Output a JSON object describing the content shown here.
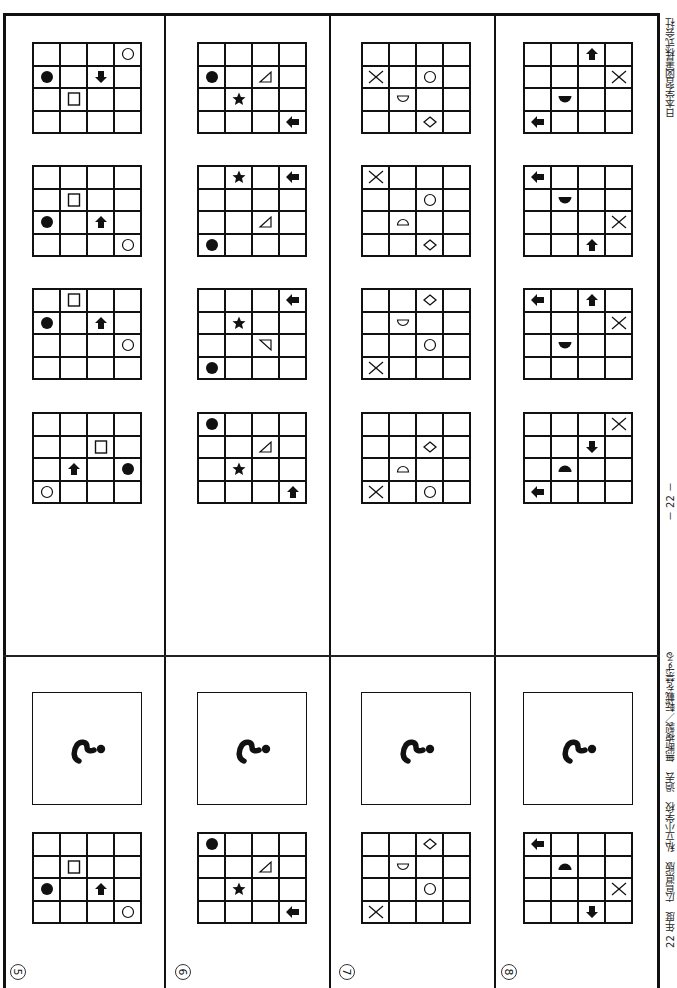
{
  "page": {
    "orientation": "rotated-90",
    "page_number": "－ 22 －",
    "footer_left": "22 年度　広島県版　私立小学校　過去　無断複製／転載を禁ずる",
    "footer_right": "日本学習図書株式会社"
  },
  "problems": [
    {
      "number": "⑤",
      "question_mark": "?",
      "example": [
        [
          "",
          "",
          "",
          ""
        ],
        [
          "",
          "square-outline",
          "",
          ""
        ],
        [
          "circle-filled",
          "",
          "arrow-up",
          ""
        ],
        [
          "",
          "",
          "",
          "circle-outline"
        ]
      ],
      "options": [
        [
          [
            "",
            "",
            "",
            "circle-outline"
          ],
          [
            "circle-filled",
            "",
            "arrow-down",
            ""
          ],
          [
            "",
            "square-outline",
            "",
            ""
          ],
          [
            "",
            "",
            "",
            ""
          ]
        ],
        [
          [
            "",
            "",
            "",
            ""
          ],
          [
            "",
            "square-outline",
            "",
            ""
          ],
          [
            "circle-filled",
            "",
            "arrow-up",
            ""
          ],
          [
            "",
            "",
            "",
            "circle-outline"
          ]
        ],
        [
          [
            "",
            "square-outline",
            "",
            ""
          ],
          [
            "circle-filled",
            "",
            "arrow-up",
            ""
          ],
          [
            "",
            "",
            "",
            "circle-outline"
          ],
          [
            "",
            "",
            "",
            ""
          ]
        ],
        [
          [
            "",
            "",
            "",
            ""
          ],
          [
            "",
            "",
            "square-outline",
            ""
          ],
          [
            "",
            "arrow-up",
            "",
            "circle-filled"
          ],
          [
            "circle-outline",
            "",
            "",
            ""
          ]
        ]
      ]
    },
    {
      "number": "⑥",
      "question_mark": "?",
      "example": [
        [
          "circle-filled",
          "",
          "",
          ""
        ],
        [
          "",
          "",
          "triangle-outline",
          ""
        ],
        [
          "",
          "star-filled",
          "",
          ""
        ],
        [
          "",
          "",
          "",
          "arrow-left"
        ]
      ],
      "options": [
        [
          [
            "",
            "",
            "",
            ""
          ],
          [
            "circle-filled",
            "",
            "triangle-outline",
            ""
          ],
          [
            "",
            "star-filled",
            "",
            ""
          ],
          [
            "",
            "",
            "",
            "arrow-left"
          ]
        ],
        [
          [
            "",
            "star-filled",
            "",
            "arrow-left"
          ],
          [
            "",
            "",
            "",
            ""
          ],
          [
            "",
            "",
            "triangle-outline",
            ""
          ],
          [
            "circle-filled",
            "",
            "",
            ""
          ]
        ],
        [
          [
            "",
            "",
            "",
            "arrow-left"
          ],
          [
            "",
            "star-filled",
            "",
            ""
          ],
          [
            "",
            "",
            "triangle-outline-flipped",
            ""
          ],
          [
            "circle-filled",
            "",
            "",
            ""
          ]
        ],
        [
          [
            "circle-filled",
            "",
            "",
            ""
          ],
          [
            "",
            "",
            "triangle-outline",
            ""
          ],
          [
            "",
            "star-filled",
            "",
            ""
          ],
          [
            "",
            "",
            "",
            "arrow-up"
          ]
        ]
      ]
    },
    {
      "number": "⑦",
      "question_mark": "?",
      "example": [
        [
          "",
          "",
          "diamond-outline",
          ""
        ],
        [
          "",
          "semicircle-outline-down",
          "",
          ""
        ],
        [
          "",
          "",
          "circle-outline",
          ""
        ],
        [
          "cross",
          "",
          "",
          ""
        ]
      ],
      "options": [
        [
          [
            "",
            "",
            "",
            ""
          ],
          [
            "cross",
            "",
            "circle-outline",
            ""
          ],
          [
            "",
            "semicircle-outline-down",
            "",
            ""
          ],
          [
            "",
            "",
            "diamond-outline",
            ""
          ]
        ],
        [
          [
            "cross",
            "",
            "",
            ""
          ],
          [
            "",
            "",
            "circle-outline",
            ""
          ],
          [
            "",
            "semicircle-outline-up",
            "",
            ""
          ],
          [
            "",
            "",
            "diamond-outline",
            ""
          ]
        ],
        [
          [
            "",
            "",
            "diamond-outline",
            ""
          ],
          [
            "",
            "semicircle-outline-down",
            "",
            ""
          ],
          [
            "",
            "",
            "circle-outline",
            ""
          ],
          [
            "cross",
            "",
            "",
            ""
          ]
        ],
        [
          [
            "",
            "",
            "",
            ""
          ],
          [
            "",
            "",
            "diamond-outline",
            ""
          ],
          [
            "",
            "semicircle-outline-up",
            "",
            ""
          ],
          [
            "cross",
            "",
            "circle-outline",
            ""
          ]
        ]
      ]
    },
    {
      "number": "⑧",
      "question_mark": "?",
      "example": [
        [
          "arrow-left",
          "",
          "",
          ""
        ],
        [
          "",
          "semicircle-filled-up",
          "",
          ""
        ],
        [
          "",
          "",
          "",
          "cross"
        ],
        [
          "",
          "",
          "arrow-down",
          ""
        ]
      ],
      "options": [
        [
          [
            "",
            "",
            "arrow-up",
            ""
          ],
          [
            "",
            "",
            "",
            "cross"
          ],
          [
            "",
            "semicircle-filled-down",
            "",
            ""
          ],
          [
            "arrow-left",
            "",
            "",
            ""
          ]
        ],
        [
          [
            "arrow-left",
            "",
            "",
            ""
          ],
          [
            "",
            "semicircle-filled-down",
            "",
            ""
          ],
          [
            "",
            "",
            "",
            "cross"
          ],
          [
            "",
            "",
            "arrow-up",
            ""
          ]
        ],
        [
          [
            "arrow-left",
            "",
            "arrow-up",
            ""
          ],
          [
            "",
            "",
            "",
            "cross"
          ],
          [
            "",
            "semicircle-filled-down",
            "",
            ""
          ],
          [
            "",
            "",
            "",
            ""
          ]
        ],
        [
          [
            "",
            "",
            "",
            "cross"
          ],
          [
            "",
            "",
            "arrow-down",
            ""
          ],
          [
            "",
            "semicircle-filled-up",
            "",
            ""
          ],
          [
            "arrow-left",
            "",
            "",
            ""
          ]
        ]
      ]
    }
  ]
}
